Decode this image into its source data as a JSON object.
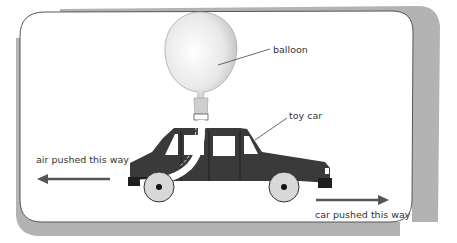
{
  "diagram": {
    "labels": {
      "balloon": "balloon",
      "toy_car": "toy car",
      "air_direction": "air pushed this way",
      "car_direction": "car pushed this way"
    },
    "arrows": [
      {
        "name": "air-arrow",
        "direction": "left",
        "label": "air pushed this way"
      },
      {
        "name": "car-arrow",
        "direction": "right",
        "label": "car pushed this way"
      }
    ],
    "colors": {
      "frame_line": "#555555",
      "frame_shadow": "#b0b0b0",
      "car_body": "#3a3a3a",
      "wheel": "#d8d8d8",
      "balloon": "#e6e6e6",
      "arrow": "#555555",
      "text": "#333333"
    }
  }
}
